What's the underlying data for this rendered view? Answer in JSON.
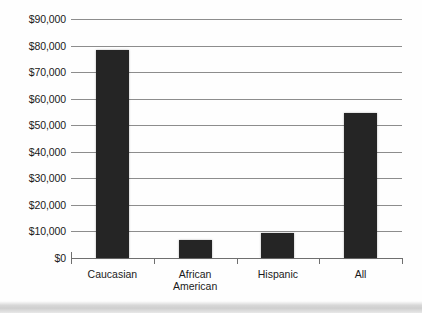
{
  "chart_data": {
    "type": "bar",
    "title": "",
    "subtitle": "",
    "xlabel": "",
    "ylabel": "",
    "categories": [
      "Caucasian",
      "African American",
      "Hispanic",
      "All"
    ],
    "values": [
      78500,
      6800,
      9300,
      54500
    ],
    "series": [
      {
        "name": "",
        "values": [
          78500,
          6800,
          9300,
          54500
        ]
      }
    ],
    "ylim": [
      0,
      90000
    ],
    "ytick_values": [
      0,
      10000,
      20000,
      30000,
      40000,
      50000,
      60000,
      70000,
      80000,
      90000
    ],
    "ytick_labels": [
      "$90,000",
      "$80,000",
      "$70,000",
      "$60,000",
      "$50,000",
      "$40,000",
      "$30,000",
      "$20,000",
      "$10,000",
      "$0"
    ],
    "grid": true,
    "grid_axis": "y",
    "legend": false,
    "legend_position": "none",
    "bar_color": "#252525",
    "gridline_color": "#8d8d8d",
    "axis_color": "#6f6f6f",
    "background_color": "#fefefe",
    "annotations": []
  },
  "axis": {
    "y_labels": [
      "$90,000",
      "$80,000",
      "$70,000",
      "$60,000",
      "$50,000",
      "$40,000",
      "$30,000",
      "$20,000",
      "$10,000",
      "$0"
    ],
    "x_labels": [
      "Caucasian",
      "African\nAmerican",
      "Hispanic",
      "All"
    ]
  }
}
